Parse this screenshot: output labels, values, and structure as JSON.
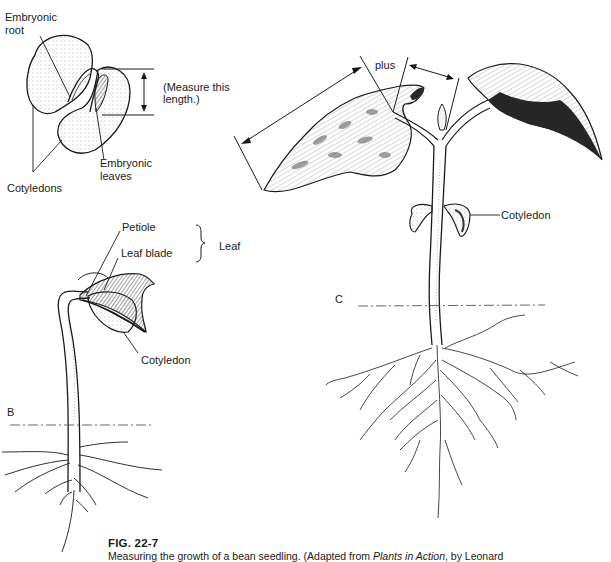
{
  "figure": {
    "number": "FIG. 22-7",
    "caption_prefix": "Measuring the growth of a bean seedling. (Adapted from ",
    "caption_title": "Plants in Action",
    "caption_suffix": ", by Leonard"
  },
  "panel_a": {
    "labels": {
      "embryonic_root_1": "Embryonic",
      "embryonic_root_2": "root",
      "measure_1": "(Measure this",
      "measure_2": "length.)",
      "embryonic_leaves_1": "Embryonic",
      "embryonic_leaves_2": "leaves",
      "cotyledons": "Cotyledons"
    }
  },
  "panel_b": {
    "panel_letter": "B",
    "labels": {
      "petiole": "Petiole",
      "leaf_blade": "Leaf blade",
      "leaf": "Leaf",
      "cotyledon": "Cotyledon"
    }
  },
  "panel_c": {
    "panel_letter": "C",
    "labels": {
      "plus": "plus",
      "cotyledon": "Cotyledon"
    }
  },
  "colors": {
    "ink": "#1a1a1a",
    "background": "#ffffff"
  }
}
